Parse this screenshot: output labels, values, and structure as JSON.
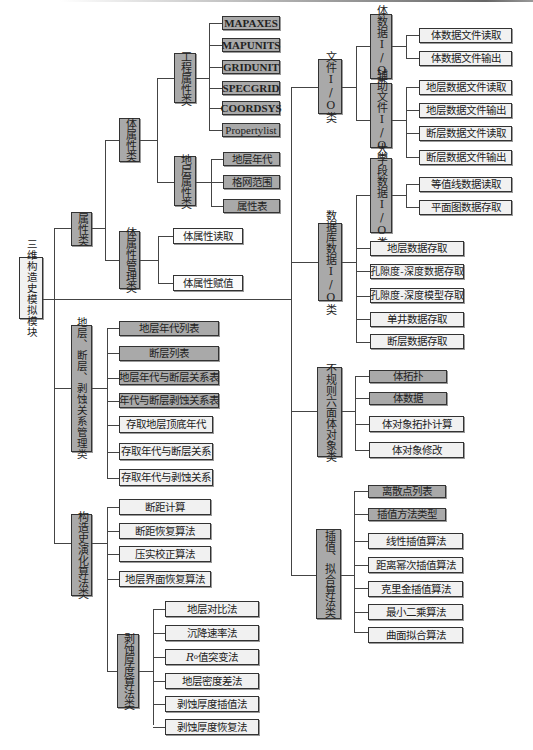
{
  "root": {
    "label": "三维构造史模拟模块"
  },
  "left": {
    "attr_class": {
      "label": "属性类",
      "body_attr": {
        "label": "体属性类",
        "engineering": {
          "label": "工程属性类",
          "items": [
            "MAPAXES",
            "MAPUNITS",
            "GRIDUNIT",
            "SPECGRID",
            "COORDSYS",
            "Propertylist"
          ]
        },
        "strata": {
          "label": "地层属性类",
          "items": [
            "地层年代",
            "格网范围",
            "属性表"
          ]
        }
      },
      "body_attr_mgmt": {
        "label": "体属性管理类",
        "items": [
          "体属性读取",
          "体属性赋值"
        ]
      }
    },
    "relation_mgmt": {
      "label": "地层、断层、剥蚀关系管理类",
      "items": [
        "地层年代列表",
        "断层列表",
        "地层年代与断层关系表",
        "年代与断层剥蚀关系表",
        "存取地层顶底年代",
        "存取年代与断层关系",
        "存取年代与剥蚀关系"
      ]
    },
    "evolution": {
      "label": "构造史演化算法类",
      "items": [
        "断距计算",
        "断距恢复算法",
        "压实校正算法",
        "地层界面恢复算法"
      ],
      "erosion": {
        "label": "剥蚀厚度算法类",
        "items": [
          "地层对比法",
          "沉降速率法",
          "值突变法",
          "地层密度差法",
          "剥蚀厚度插值法",
          "剥蚀厚度恢复法"
        ],
        "ro_symbol": "R",
        "ro_sub": "o"
      }
    }
  },
  "right": {
    "file_io": {
      "label": "文件I/O类",
      "body_io": {
        "label": "体数据I/O类",
        "items": [
          "体数据文件读取",
          "体数据文件输出"
        ]
      },
      "aux_io": {
        "label": "辅助文件I/O类",
        "items": [
          "地层数据文件读取",
          "地层数据文件输出",
          "断层数据文件读取",
          "断层数据文件输出"
        ]
      }
    },
    "db_io": {
      "label": "数据库数据I/O类",
      "big_field": {
        "label": "大字段数据I/O类",
        "items": [
          "等值线数据读取",
          "平面图数据存取"
        ]
      },
      "items": [
        "地层数据存取",
        "孔隙度-深度数据存取",
        "孔隙度-深度模型存取",
        "单井数据存取",
        "断层数据存取"
      ]
    },
    "hexa": {
      "label": "不规则六面体对象类",
      "items": [
        "体拓扑",
        "体数据",
        "体对象拓扑计算",
        "体对象修改"
      ]
    },
    "interp": {
      "label": "插值、拟合算法类",
      "items": [
        "离散点列表",
        "插值方法类型",
        "线性插值算法",
        "距离幂次插值算法",
        "克里金插值算法",
        "最小二乘算法",
        "曲面拟合算法"
      ]
    }
  },
  "colors": {
    "dark_box": "#a9a9a9",
    "light_box": "#f1f1f1",
    "line": "#444444"
  }
}
